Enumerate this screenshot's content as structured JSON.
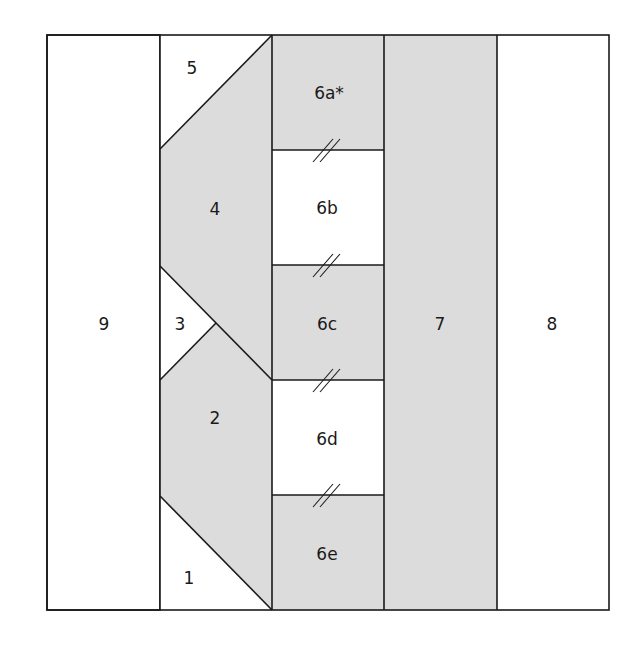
{
  "diagram": {
    "colors": {
      "shaded": "#dcdcdc",
      "unshaded": "#ffffff",
      "line": "#1a1a1a"
    },
    "pieces": [
      {
        "id": "1",
        "label": "1",
        "shaded": false
      },
      {
        "id": "2",
        "label": "2",
        "shaded": true
      },
      {
        "id": "3",
        "label": "3",
        "shaded": false
      },
      {
        "id": "4",
        "label": "4",
        "shaded": true
      },
      {
        "id": "5",
        "label": "5",
        "shaded": false
      },
      {
        "id": "6a",
        "label": "6a*",
        "shaded": true
      },
      {
        "id": "6b",
        "label": "6b",
        "shaded": false
      },
      {
        "id": "6c",
        "label": "6c",
        "shaded": true
      },
      {
        "id": "6d",
        "label": "6d",
        "shaded": false
      },
      {
        "id": "6e",
        "label": "6e",
        "shaded": true
      },
      {
        "id": "7",
        "label": "7",
        "shaded": true
      },
      {
        "id": "8",
        "label": "8",
        "shaded": false
      },
      {
        "id": "9",
        "label": "9",
        "shaded": false
      }
    ],
    "seam_marks": [
      "6a-6b",
      "6b-6c",
      "6c-6d",
      "6d-6e"
    ]
  }
}
